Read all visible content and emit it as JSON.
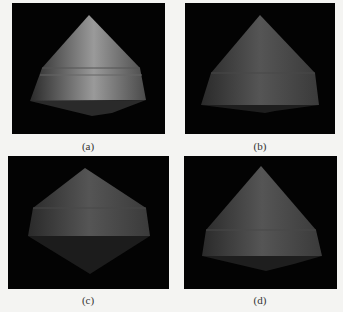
{
  "figure": {
    "panels": [
      {
        "id": "a",
        "caption": "(a)",
        "description": "cone-shaped capsule, lit from side"
      },
      {
        "id": "b",
        "caption": "(b)",
        "description": "cone-shaped capsule, dimmer shading"
      },
      {
        "id": "c",
        "caption": "(c)",
        "description": "cone-shaped capsule viewed from below, diamond silhouette"
      },
      {
        "id": "d",
        "caption": "(d)",
        "description": "cone-shaped capsule, slight downward tilt"
      }
    ],
    "colors": {
      "background": "#030303",
      "page": "#f4f4f2",
      "body_light": "#8a8a8a",
      "body_dark": "#3a3a3a"
    }
  }
}
